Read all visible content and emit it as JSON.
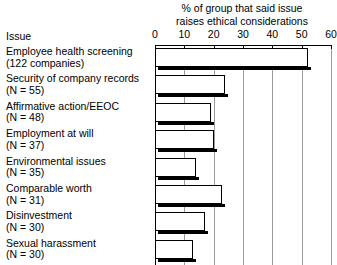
{
  "chart_data": {
    "type": "bar",
    "orientation": "horizontal",
    "title": "% of group that said issue raises ethical considerations",
    "title_lines": [
      "% of group that said issue",
      "raises ethical considerations"
    ],
    "category_axis_header": "Issue",
    "xlabel": "",
    "ylabel": "",
    "xlim": [
      0,
      60
    ],
    "xticks": [
      0,
      10,
      20,
      30,
      40,
      50,
      60
    ],
    "xtick_labels": [
      "0",
      "10",
      "20",
      "30",
      "40",
      "50",
      "60"
    ],
    "grid": true,
    "grid_axis": "x",
    "legend": false,
    "categories": [
      "Employee health screening (122 companies)",
      "Security of company records (N = 55)",
      "Affirmative action/EEOC (N = 48)",
      "Employment at will (N = 37)",
      "Environmental issues (N = 35)",
      "Comparable worth (N = 31)",
      "Disinvestment (N = 30)",
      "Sexual harassment (N = 30)"
    ],
    "category_lines": [
      {
        "line1": "Employee health screening",
        "line2": "(122 companies)"
      },
      {
        "line1": "Security of company records",
        "line2": "(N = 55)"
      },
      {
        "line1": "Affirmative action/EEOC",
        "line2": "(N = 48)"
      },
      {
        "line1": "Employment at will",
        "line2": "(N = 37)"
      },
      {
        "line1": "Environmental issues",
        "line2": "(N = 35)"
      },
      {
        "line1": "Comparable worth",
        "line2": "(N = 31)"
      },
      {
        "line1": "Disinvestment",
        "line2": "(N = 30)"
      },
      {
        "line1": "Sexual harassment",
        "line2": "(N = 30)"
      }
    ],
    "group_sizes": [
      122,
      55,
      48,
      37,
      35,
      31,
      30,
      30
    ],
    "values": [
      52,
      24,
      19,
      20,
      14,
      23,
      17,
      13
    ],
    "value_unit": "%",
    "colors": {
      "bar_fill": "#ffffff",
      "bar_outline": "#000000",
      "bar_shadow": "#000000",
      "gridline": "#9a9a9a",
      "axis": "#000000",
      "text": "#000000",
      "background": "#ffffff"
    }
  }
}
